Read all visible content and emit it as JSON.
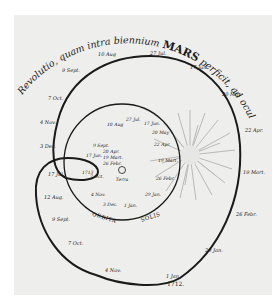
{
  "title": {
    "prefix": "Revolutio, quam intra biennium",
    "planet": "MARS",
    "suffix": "perficit, ad oculi Tyconis exhibita."
  },
  "center": {
    "label": "Terra"
  },
  "sun_orbit": {
    "caption_left": "ORBITA",
    "caption_right": "SOLIS",
    "dates": [
      "10 Aug",
      "27 Jul.",
      "17 Jun.",
      "20 May",
      "22 Apr.",
      "19 Mart.",
      "26 Febr.",
      "29 Jan.",
      "1 Jan.",
      "3 Dec.",
      "4 Nov.",
      "7 Oct.",
      "9 Sept."
    ]
  },
  "mars_path": {
    "dates_outer": [
      "10 Aug",
      "27 Jul.",
      "17 Jun.",
      "20 May",
      "22 Apr.",
      "19 Mart.",
      "26 Febr.",
      "29 Jan.",
      "1 Jan.",
      "4 Nov.",
      "7 Oct.",
      "9 Sept.",
      "12 Aug.",
      "17 Jul.",
      "3 Dec.",
      "4 Nov.",
      "7 Oct.",
      "9 Sept."
    ],
    "loop_labels": [
      "17 Jun.",
      "1713",
      "20 Apr.",
      "19 Mart.",
      "26 Febr."
    ],
    "start_year": "1712."
  },
  "colors": {
    "paper": "#eeeeec",
    "ink": "#1a1a1a",
    "sun": "#9a9a9a"
  }
}
